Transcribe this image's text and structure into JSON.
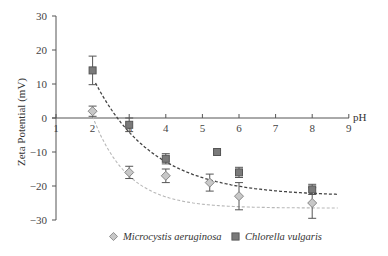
{
  "chart_data": {
    "type": "scatter",
    "title": "",
    "xlabel": "pH",
    "ylabel": "Zeta Potential (mV)",
    "xlim": [
      1,
      9
    ],
    "ylim": [
      -30,
      30
    ],
    "x_ticks": [
      "1",
      "2",
      "3",
      "4",
      "5",
      "6",
      "7",
      "8",
      "9"
    ],
    "y_ticks": [
      "30",
      "20",
      "10",
      "0",
      "−10",
      "−20",
      "−30"
    ],
    "grid": false,
    "legend_position": "bottom",
    "series": [
      {
        "name": "Microcystis aeruginosa",
        "marker": "diamond",
        "color": "#c8c8c8",
        "edge_color": "#888888",
        "fit_line": "light-gray dashed exponential decay",
        "fit_color": "#b8b8b8",
        "x": [
          2,
          3,
          4,
          5.2,
          6,
          8
        ],
        "y": [
          2,
          -16,
          -17,
          -19,
          -23,
          -25
        ],
        "error": [
          1.5,
          1.8,
          2,
          2.5,
          4,
          4.5
        ]
      },
      {
        "name": "Chlorella vulgaris",
        "marker": "square",
        "color": "#7a7a7a",
        "edge_color": "#555555",
        "fit_line": "dark dashed exponential decay",
        "fit_color": "#444444",
        "x": [
          2,
          3,
          4,
          5.4,
          6,
          8
        ],
        "y": [
          14,
          -2,
          -12,
          -10,
          -16,
          -21
        ],
        "error": [
          4.2,
          2,
          1.5,
          0.5,
          1.5,
          1.5
        ]
      }
    ]
  },
  "legend": {
    "items": [
      {
        "label": "Microcystis aeruginosa",
        "marker": "diamond"
      },
      {
        "label": "Chlorella vulgaris",
        "marker": "square"
      }
    ]
  }
}
